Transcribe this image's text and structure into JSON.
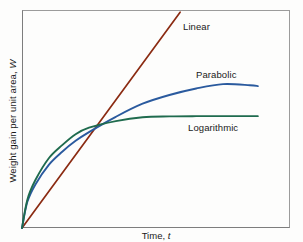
{
  "figure": {
    "width": 303,
    "height": 242,
    "background": "#fdfdfc",
    "frame_color": "#9b9b9b"
  },
  "axes": {
    "y_title": "Weight gain per unit area, W",
    "y_title_symbol": "W",
    "y_title_text": "Weight gain per unit area,",
    "x_title_text": "Time,",
    "x_title_symbol": "t"
  },
  "labels": {
    "linear": "Linear",
    "parabolic": "Parabolic",
    "logarithmic": "Logarithmic"
  },
  "colors": {
    "linear": "#8B2B12",
    "parabolic": "#2A5A9E",
    "logarithmic": "#1F6B4E",
    "frame": "#9b9b9b",
    "text": "#1a1a1a"
  },
  "chart_data": {
    "type": "line",
    "title": "",
    "subtitle": "",
    "xlabel": "Time, t",
    "ylabel": "Weight gain per unit area, W",
    "xlim": [
      0,
      1
    ],
    "ylim": [
      0,
      1
    ],
    "grid": false,
    "axis_ticks": "none",
    "legend": "inline-curve-labels",
    "note": "Schematic oxidation kinetics plot: three unlabeled-scale curves all starting at the origin. Values below are normalized fractions of the plot box (x: 0 at left axis, 1 at right frame; y: 0 at bottom axis, 1 at top frame).",
    "series": [
      {
        "name": "Linear",
        "color": "#8B2B12",
        "law": "W = k*t",
        "x": [
          0.0,
          0.1,
          0.2,
          0.3,
          0.4,
          0.5,
          0.59
        ],
        "y": [
          0.0,
          0.16,
          0.33,
          0.49,
          0.66,
          0.82,
          0.99
        ],
        "label_position": {
          "x": 0.6,
          "y": 0.92
        }
      },
      {
        "name": "Parabolic",
        "color": "#2A5A9E",
        "law": "W^2 = k*t",
        "x": [
          0.0,
          0.02,
          0.05,
          0.1,
          0.15,
          0.2,
          0.25,
          0.35,
          0.45,
          0.55,
          0.65,
          0.75,
          0.85,
          0.88
        ],
        "y": [
          0.0,
          0.12,
          0.2,
          0.29,
          0.35,
          0.4,
          0.44,
          0.51,
          0.57,
          0.61,
          0.64,
          0.66,
          0.655,
          0.651
        ],
        "label_position": {
          "x": 0.65,
          "y": 0.7
        }
      },
      {
        "name": "Logarithmic",
        "color": "#1F6B4E",
        "law": "W = k*log(ct + 1)",
        "x": [
          0.0,
          0.02,
          0.05,
          0.1,
          0.15,
          0.2,
          0.25,
          0.35,
          0.45,
          0.55,
          0.65,
          0.75,
          0.85,
          0.88
        ],
        "y": [
          0.0,
          0.13,
          0.22,
          0.32,
          0.38,
          0.43,
          0.46,
          0.49,
          0.508,
          0.512,
          0.513,
          0.513,
          0.513,
          0.513
        ],
        "label_position": {
          "x": 0.62,
          "y": 0.46
        }
      }
    ],
    "crossover_point": {
      "x": 0.24,
      "y": 0.38,
      "description": "All three curves intersect near this point"
    }
  }
}
